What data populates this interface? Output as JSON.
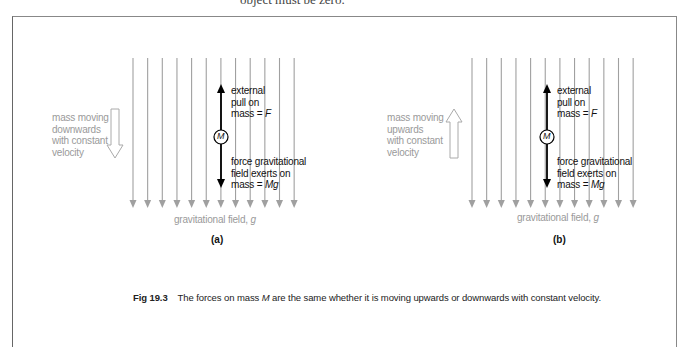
{
  "top_fragment": "object must be zero.",
  "panels": [
    {
      "id": "a",
      "label": "(a)",
      "motion_label": [
        "mass moving",
        "downwards",
        "with constant",
        "velocity"
      ],
      "motion_direction": "down",
      "mass_symbol": "M",
      "upper_force": {
        "lines": [
          "external",
          "pull on"
        ],
        "eq_prefix": "mass = ",
        "eq_var": "F"
      },
      "lower_force": {
        "lines": [
          "force gravitational",
          "field exerts on"
        ],
        "eq_prefix": "mass = ",
        "eq_var": "Mg"
      },
      "field_label_text": "gravitational field, ",
      "field_label_var": "g"
    },
    {
      "id": "b",
      "label": "(b)",
      "motion_label": [
        "mass moving",
        "upwards",
        "with constant",
        "velocity"
      ],
      "motion_direction": "up",
      "mass_symbol": "M",
      "upper_force": {
        "lines": [
          "external",
          "pull on"
        ],
        "eq_prefix": "mass = ",
        "eq_var": "F"
      },
      "lower_force": {
        "lines": [
          "force gravitational",
          "field exerts on"
        ],
        "eq_prefix": "mass = ",
        "eq_var": "Mg"
      },
      "field_label_text": "gravitational field, ",
      "field_label_var": "g"
    }
  ],
  "caption": {
    "number": "Fig 19.3",
    "text_before": "The forces on mass ",
    "var": "M",
    "text_after": " are the same whether it is moving upwards or downwards with constant velocity."
  },
  "colors": {
    "field_lines": "#a0a0a0",
    "force_arrows": "#000000",
    "motion_arrow": "#aaaaaa",
    "frame": "#777777"
  }
}
